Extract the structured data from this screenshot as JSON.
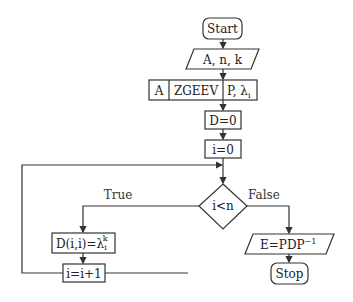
{
  "diagram": {
    "type": "flowchart",
    "nodes": {
      "start": {
        "label": "Start",
        "shape": "rounded-rectangle"
      },
      "input": {
        "label": "A, n, k",
        "shape": "parallelogram"
      },
      "zgeev": {
        "inputs": "A",
        "label": "ZGEEV",
        "outputs_prefix": "P, λ",
        "outputs_sub": "i",
        "shape": "split-rectangle"
      },
      "init_d": {
        "label": "D=0",
        "shape": "rectangle"
      },
      "init_i": {
        "label": "i=0",
        "shape": "rectangle"
      },
      "decision": {
        "label": "i<n",
        "shape": "diamond"
      },
      "assign_d": {
        "prefix": "D(i,i)=λ",
        "sub": "i",
        "sup": "k",
        "shape": "rectangle"
      },
      "increment": {
        "label": "i=i+1",
        "shape": "rectangle"
      },
      "output": {
        "prefix": "E=PDP",
        "sup": "−1",
        "shape": "parallelogram"
      },
      "stop": {
        "label": "Stop",
        "shape": "rounded-rectangle"
      }
    },
    "edge_labels": {
      "true": "True",
      "false": "False"
    },
    "colors": {
      "stroke": "#333333",
      "text": "#222222",
      "background": "#ffffff"
    }
  }
}
